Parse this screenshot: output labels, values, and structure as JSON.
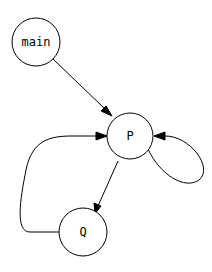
{
  "diagram": {
    "type": "directed-graph",
    "nodes": [
      {
        "id": "main",
        "label": "main"
      },
      {
        "id": "P",
        "label": "P"
      },
      {
        "id": "Q",
        "label": "Q"
      }
    ],
    "edges": [
      {
        "from": "main",
        "to": "P"
      },
      {
        "from": "P",
        "to": "P"
      },
      {
        "from": "P",
        "to": "Q"
      },
      {
        "from": "Q",
        "to": "P"
      }
    ]
  }
}
